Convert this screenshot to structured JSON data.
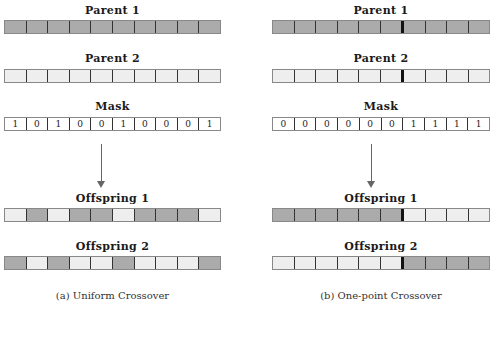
{
  "colors": {
    "parent1": "#ababab",
    "parent2": "#eeeeee",
    "mask": "#ffffff",
    "cut_line": "#111111"
  },
  "panels": [
    {
      "id": "uniform",
      "caption": "(a) Uniform Crossover",
      "rows": {
        "parent1": {
          "label": "Parent 1",
          "cells": [
            "dark",
            "dark",
            "dark",
            "dark",
            "dark",
            "dark",
            "dark",
            "dark",
            "dark",
            "dark"
          ]
        },
        "parent2": {
          "label": "Parent 2",
          "cells": [
            "light",
            "light",
            "light",
            "light",
            "light",
            "light",
            "light",
            "light",
            "light",
            "light"
          ]
        },
        "mask": {
          "label": "Mask",
          "values": [
            "1",
            "0",
            "1",
            "0",
            "0",
            "1",
            "0",
            "0",
            "0",
            "1"
          ]
        },
        "offspring1": {
          "label": "Offspring 1",
          "cells": [
            "light",
            "dark",
            "light",
            "dark",
            "dark",
            "light",
            "dark",
            "dark",
            "dark",
            "light"
          ]
        },
        "offspring2": {
          "label": "Offspring 2",
          "cells": [
            "dark",
            "light",
            "dark",
            "light",
            "light",
            "dark",
            "light",
            "light",
            "light",
            "dark"
          ]
        }
      },
      "crossover_point": null
    },
    {
      "id": "one-point",
      "caption": "(b) One-point Crossover",
      "rows": {
        "parent1": {
          "label": "Parent 1",
          "cells": [
            "dark",
            "dark",
            "dark",
            "dark",
            "dark",
            "dark",
            "dark",
            "dark",
            "dark",
            "dark"
          ]
        },
        "parent2": {
          "label": "Parent 2",
          "cells": [
            "light",
            "light",
            "light",
            "light",
            "light",
            "light",
            "light",
            "light",
            "light",
            "light"
          ]
        },
        "mask": {
          "label": "Mask",
          "values": [
            "0",
            "0",
            "0",
            "0",
            "0",
            "0",
            "1",
            "1",
            "1",
            "1"
          ]
        },
        "offspring1": {
          "label": "Offspring 1",
          "cells": [
            "dark",
            "dark",
            "dark",
            "dark",
            "dark",
            "dark",
            "light",
            "light",
            "light",
            "light"
          ]
        },
        "offspring2": {
          "label": "Offspring 2",
          "cells": [
            "light",
            "light",
            "light",
            "light",
            "light",
            "light",
            "dark",
            "dark",
            "dark",
            "dark"
          ]
        }
      },
      "crossover_point": 6
    }
  ]
}
